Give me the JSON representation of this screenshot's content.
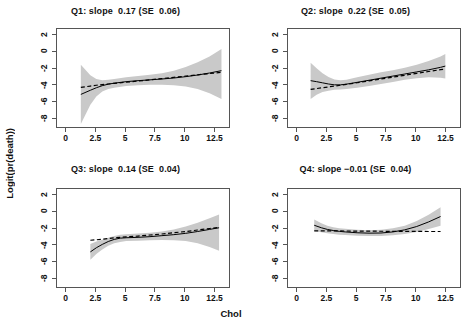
{
  "figure": {
    "xlabel": "Chol",
    "ylabel": "Logit(pr(death))"
  },
  "chart_data": {
    "type": "line",
    "title": "",
    "xlabel": "Chol",
    "ylabel": "Logit(pr(death))",
    "xlim": [
      -0.8,
      13.8
    ],
    "ylim": [
      -9.2,
      2.8
    ],
    "xticks": [
      0,
      2.5,
      5,
      7.5,
      10,
      12.5
    ],
    "xticklabels": [
      "0",
      "2.5",
      "5",
      "7.5",
      "10",
      "12.5"
    ],
    "yticks": [
      2,
      0,
      -2,
      -4,
      -6,
      -8
    ],
    "yticklabels": [
      "2",
      "0",
      "-2",
      "-4",
      "-6",
      "-8"
    ],
    "grid": false,
    "legend": null,
    "layout": "2x2 panel grid",
    "series_styles": {
      "fit": "solid black line",
      "reference": "dashed black line",
      "band": "grey 95% confidence band"
    },
    "panels": [
      {
        "id": "Q1",
        "title": "Q1: slope  0.17 (SE  0.06)",
        "slope": 0.17,
        "se": 0.06,
        "x": [
          1.2,
          2.0,
          2.5,
          3.0,
          3.5,
          4.0,
          5.0,
          6.0,
          7.0,
          8.0,
          9.0,
          10.0,
          11.0,
          12.0,
          13.0
        ],
        "fit": [
          -5.05,
          -4.55,
          -4.25,
          -4.0,
          -3.82,
          -3.7,
          -3.52,
          -3.4,
          -3.3,
          -3.2,
          -3.08,
          -2.92,
          -2.72,
          -2.48,
          -2.2
        ],
        "lower": [
          -8.6,
          -6.3,
          -5.3,
          -4.7,
          -4.4,
          -4.25,
          -4.05,
          -3.95,
          -3.9,
          -3.9,
          -3.95,
          -4.1,
          -4.4,
          -4.9,
          -5.6
        ],
        "upper": [
          -1.5,
          -2.75,
          -3.2,
          -3.35,
          -3.3,
          -3.2,
          -3.0,
          -2.85,
          -2.7,
          -2.5,
          -2.2,
          -1.75,
          -1.2,
          -0.5,
          0.4
        ],
        "dashed": [
          -4.2,
          -4.05,
          -3.95,
          -3.88,
          -3.8,
          -3.72,
          -3.58,
          -3.45,
          -3.3,
          -3.15,
          -3.0,
          -2.85,
          -2.7,
          -2.55,
          -2.4
        ]
      },
      {
        "id": "Q2",
        "title": "Q2: slope  0.22 (SE  0.05)",
        "slope": 0.22,
        "se": 0.05,
        "x": [
          1.1,
          1.6,
          2.1,
          2.6,
          3.1,
          3.6,
          4.1,
          5.0,
          6.0,
          7.0,
          8.0,
          9.0,
          10.0,
          11.0,
          12.0,
          12.4
        ],
        "fit": [
          -3.4,
          -3.52,
          -3.66,
          -3.8,
          -3.9,
          -3.9,
          -3.82,
          -3.6,
          -3.35,
          -3.1,
          -2.85,
          -2.6,
          -2.35,
          -2.1,
          -1.8,
          -1.65
        ],
        "lower": [
          -5.6,
          -5.1,
          -4.75,
          -4.6,
          -4.5,
          -4.45,
          -4.4,
          -4.25,
          -4.05,
          -3.8,
          -3.55,
          -3.3,
          -3.1,
          -3.0,
          -3.05,
          -3.15
        ],
        "upper": [
          -1.25,
          -1.9,
          -2.5,
          -2.95,
          -3.25,
          -3.35,
          -3.3,
          -3.0,
          -2.68,
          -2.4,
          -2.15,
          -1.85,
          -1.5,
          -1.05,
          -0.5,
          -0.2
        ],
        "dashed": [
          -4.45,
          -4.35,
          -4.25,
          -4.15,
          -4.05,
          -3.95,
          -3.85,
          -3.65,
          -3.42,
          -3.2,
          -2.98,
          -2.75,
          -2.52,
          -2.3,
          -2.08,
          -2.0
        ]
      },
      {
        "id": "Q3",
        "title": "Q3: slope  0.14 (SE  0.04)",
        "slope": 0.14,
        "se": 0.04,
        "x": [
          2.0,
          2.5,
          3.0,
          3.5,
          4.0,
          4.5,
          5.0,
          6.0,
          7.0,
          8.0,
          9.0,
          10.0,
          11.0,
          12.0,
          12.8
        ],
        "fit": [
          -4.75,
          -4.25,
          -3.85,
          -3.5,
          -3.25,
          -3.1,
          -3.05,
          -3.0,
          -2.92,
          -2.8,
          -2.68,
          -2.52,
          -2.3,
          -2.05,
          -1.85
        ],
        "lower": [
          -5.7,
          -5.0,
          -4.45,
          -4.0,
          -3.7,
          -3.55,
          -3.45,
          -3.4,
          -3.35,
          -3.32,
          -3.35,
          -3.45,
          -3.7,
          -4.15,
          -4.6
        ],
        "upper": [
          -3.8,
          -3.5,
          -3.28,
          -3.05,
          -2.85,
          -2.7,
          -2.62,
          -2.55,
          -2.45,
          -2.3,
          -2.05,
          -1.7,
          -1.25,
          -0.7,
          -0.25
        ],
        "dashed": [
          -3.35,
          -3.3,
          -3.22,
          -3.15,
          -3.05,
          -3.0,
          -2.95,
          -2.85,
          -2.72,
          -2.6,
          -2.45,
          -2.3,
          -2.12,
          -1.95,
          -1.8
        ]
      },
      {
        "id": "Q4",
        "title": "Q4: slope −0.01 (SE  0.04)",
        "slope": -0.01,
        "se": 0.04,
        "x": [
          1.4,
          2.0,
          2.5,
          3.0,
          3.5,
          4.0,
          5.0,
          6.0,
          7.0,
          8.0,
          9.0,
          10.0,
          11.0,
          12.0
        ],
        "fit": [
          -1.55,
          -1.85,
          -2.05,
          -2.18,
          -2.28,
          -2.35,
          -2.45,
          -2.5,
          -2.48,
          -2.35,
          -2.1,
          -1.7,
          -1.15,
          -0.5
        ],
        "lower": [
          -2.25,
          -2.4,
          -2.5,
          -2.6,
          -2.68,
          -2.72,
          -2.8,
          -2.85,
          -2.85,
          -2.75,
          -2.6,
          -2.35,
          -2.0,
          -1.6
        ],
        "upper": [
          -0.85,
          -1.3,
          -1.6,
          -1.78,
          -1.9,
          -1.98,
          -2.1,
          -2.15,
          -2.1,
          -1.92,
          -1.6,
          -1.05,
          -0.3,
          0.6
        ],
        "dashed": [
          -2.22,
          -2.22,
          -2.22,
          -2.23,
          -2.23,
          -2.24,
          -2.25,
          -2.26,
          -2.27,
          -2.28,
          -2.28,
          -2.29,
          -2.3,
          -2.3
        ]
      }
    ]
  },
  "panel_titles": {
    "q1": "Q1: slope  0.17 (SE  0.06)",
    "q2": "Q2: slope  0.22 (SE  0.05)",
    "q3": "Q3: slope  0.14 (SE  0.04)",
    "q4": "Q4: slope −0.01 (SE  0.04)"
  },
  "colors": {
    "band": "#c9c9c9",
    "line": "#000000",
    "axis": "#555555",
    "background": "#ffffff"
  }
}
